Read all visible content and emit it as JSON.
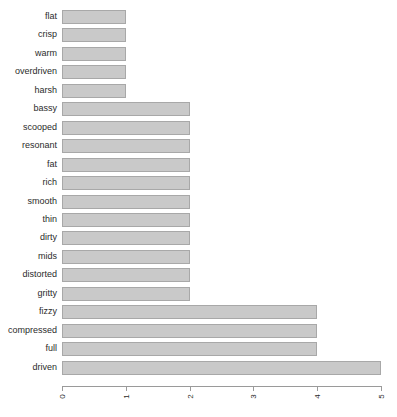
{
  "chart_data": {
    "type": "bar",
    "orientation": "horizontal",
    "title": "",
    "subtitle": "",
    "xlabel": "",
    "ylabel": "",
    "categories": [
      "flat",
      "crisp",
      "warm",
      "overdriven",
      "harsh",
      "bassy",
      "scooped",
      "resonant",
      "fat",
      "rich",
      "smooth",
      "thin",
      "dirty",
      "mids",
      "distorted",
      "gritty",
      "fizzy",
      "compressed",
      "full",
      "driven"
    ],
    "values": [
      1,
      1,
      1,
      1,
      1,
      2,
      2,
      2,
      2,
      2,
      2,
      2,
      2,
      2,
      2,
      2,
      4,
      4,
      4,
      5
    ],
    "xlim": [
      0,
      5
    ],
    "xticks": [
      0,
      1,
      2,
      3,
      4,
      5
    ],
    "xtick_labels": [
      "0",
      "1",
      "2",
      "3",
      "4",
      "5"
    ],
    "xtick_label_rotation": 90,
    "grid": false,
    "legend": false,
    "bar_fill_color": "#c9c9c9",
    "bar_border_color": "#a8a8a8",
    "axis_color": "#9a9a9a",
    "text_color": "#2b2b2b",
    "background_color": "#ffffff"
  },
  "caption": {
    "clipped_text": ""
  }
}
